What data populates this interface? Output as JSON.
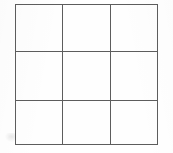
{
  "figure": {
    "title": "",
    "kind": "3x3 empty grid",
    "background_color": "#ffffff",
    "line_color": "#5d5d5d",
    "cell_fill_color": "#fefefe",
    "rows": 3,
    "columns": 3
  },
  "grid": {
    "cells": [
      [
        {
          "id": "r1c1",
          "label": ""
        },
        {
          "id": "r1c2",
          "label": ""
        },
        {
          "id": "r1c3",
          "label": ""
        }
      ],
      [
        {
          "id": "r2c1",
          "label": ""
        },
        {
          "id": "r2c2",
          "label": ""
        },
        {
          "id": "r2c3",
          "label": ""
        }
      ],
      [
        {
          "id": "r3c1",
          "label": ""
        },
        {
          "id": "r3c2",
          "label": ""
        },
        {
          "id": "r3c3",
          "label": ""
        }
      ]
    ]
  },
  "chart_data": {
    "type": "table",
    "title": "",
    "xlabel": "",
    "ylabel": "",
    "columns": [
      "",
      "",
      ""
    ],
    "rows": [
      [
        "",
        "",
        ""
      ],
      [
        "",
        "",
        ""
      ],
      [
        "",
        "",
        ""
      ]
    ],
    "grid": true,
    "legend": []
  }
}
